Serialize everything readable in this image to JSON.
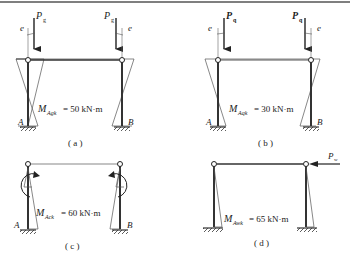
{
  "colors": {
    "line": "#333333",
    "thin": "#555555",
    "rule": "#555555"
  },
  "panels": [
    {
      "id": "a",
      "caption": "( a )",
      "load_symbol": "P",
      "load_sub": "g",
      "ecc": "e",
      "moment_label": "M",
      "moment_sub": "Agk",
      "moment_value": "= 50 kN·m",
      "support_left": "A",
      "support_right": "B"
    },
    {
      "id": "b",
      "caption": "( b )",
      "load_symbol": "P",
      "load_sub": "q",
      "ecc": "e",
      "moment_label": "M",
      "moment_sub": "Aqk",
      "moment_value": "= 30 kN·m",
      "support_left": "A",
      "support_right": "B"
    },
    {
      "id": "c",
      "caption": "( c )",
      "moment_label": "M",
      "moment_sub": "Ack",
      "moment_value": "= 60 kN·m",
      "support_left": "A",
      "support_right": "B"
    },
    {
      "id": "d",
      "caption": "( d )",
      "load_symbol": "P",
      "load_sub": "w",
      "moment_label": "M",
      "moment_sub": "Awk",
      "moment_value": "= 65 kN·m"
    }
  ]
}
